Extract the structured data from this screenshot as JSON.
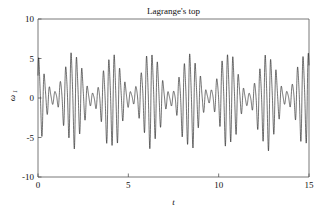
{
  "chart_data": {
    "type": "line",
    "title": "Lagrange's top",
    "xlabel": "t",
    "ylabel": "ω₁",
    "ylabel_symbol": "ω",
    "ylabel_subscript": "1",
    "xlim": [
      0,
      15
    ],
    "ylim": [
      -10,
      10
    ],
    "xticks": [
      0,
      5,
      10,
      15
    ],
    "xtick_labels": [
      "0",
      "5",
      "10",
      "15"
    ],
    "yticks": [
      -10,
      -5,
      0,
      5,
      10
    ],
    "ytick_labels": [
      "-10",
      "-5",
      "0",
      "5",
      "10"
    ],
    "grid": false,
    "legend": false,
    "line_color": "#1a1a1a",
    "axis_color": "#555555",
    "background_color": "#ffffff",
    "series": [
      {
        "name": "omega_1",
        "description": "Amplitude-modulated beating oscillation: fast carrier frequency ~3.35 cycles per unit t modulated by a slow beat envelope producing ~7 beat nodes across t = 0 to 15.",
        "carrier_cycles_per_unit": 3.35,
        "beat_cycles_per_unit": 0.466,
        "envelope_mean_amplitude": 3.55,
        "envelope_modulation_depth": 2.75,
        "baseline": 0.0,
        "peak_max": 6.35,
        "peak_min": -6.45,
        "node_amplitude": 0.85,
        "samples": 3000
      }
    ],
    "annotations": []
  },
  "plot_geometry": {
    "left_px": 38,
    "right_px": 309,
    "top_px": 19,
    "bottom_px": 177,
    "tick_length_px": 3.5
  },
  "figure": {
    "width": 326,
    "height": 212
  }
}
